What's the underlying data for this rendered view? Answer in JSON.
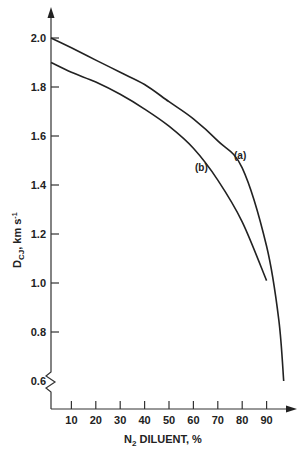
{
  "chart_data": {
    "type": "line",
    "title": "",
    "xlabel": "N₂ DILUENT, %",
    "ylabel": "D_CJ, km s⁻¹",
    "xlim": [
      0,
      100
    ],
    "ylim": [
      0.6,
      2.0
    ],
    "x_ticks": [
      10,
      20,
      30,
      40,
      50,
      60,
      70,
      80,
      90
    ],
    "y_ticks": [
      0.6,
      0.8,
      1.0,
      1.2,
      1.4,
      1.6,
      1.8,
      2.0
    ],
    "y_axis_break": true,
    "grid": false,
    "legend": "none (inline curve labels)",
    "series": [
      {
        "name": "(a)",
        "x": [
          0,
          10,
          20,
          30,
          40,
          50,
          60,
          70,
          80,
          90,
          95,
          97
        ],
        "y": [
          2.0,
          1.96,
          1.91,
          1.86,
          1.81,
          1.74,
          1.67,
          1.58,
          1.47,
          1.15,
          0.85,
          0.6
        ]
      },
      {
        "name": "(b)",
        "x": [
          0,
          10,
          20,
          30,
          40,
          50,
          60,
          70,
          80,
          90
        ],
        "y": [
          1.9,
          1.86,
          1.82,
          1.77,
          1.71,
          1.64,
          1.55,
          1.42,
          1.25,
          1.01
        ]
      }
    ]
  },
  "labels": {
    "y_title_main": "D",
    "y_title_sub": "CJ",
    "y_title_rest": ", km s",
    "y_title_sup": "-1",
    "x_title_main": "N",
    "x_title_sub": "2",
    "x_title_rest": " DILUENT, %",
    "series_a": "(a)",
    "series_b": "(b)"
  }
}
